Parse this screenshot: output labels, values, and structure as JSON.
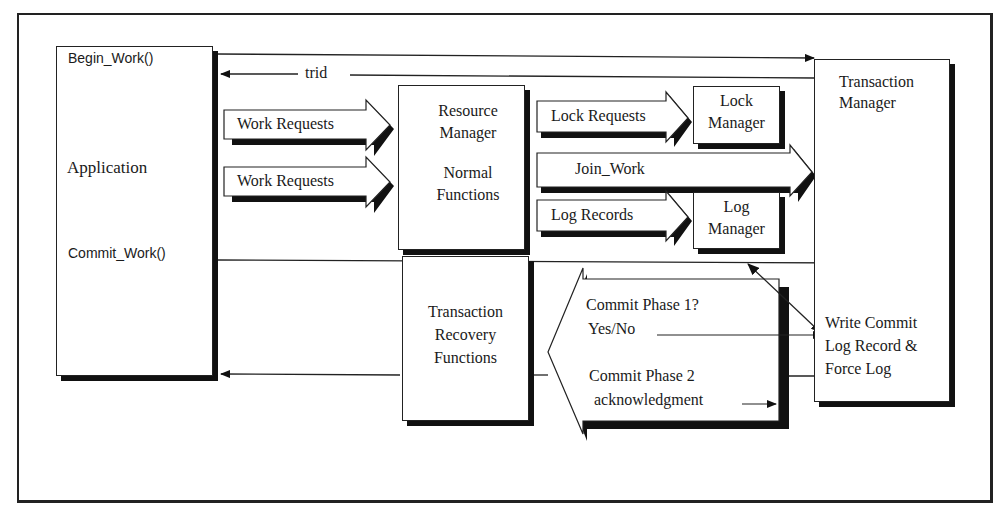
{
  "diagram": {
    "application": {
      "label": "Application",
      "begin_work": "Begin_Work()",
      "commit_work": "Commit_Work()"
    },
    "trid_label": "trid",
    "work_requests": [
      "Work Requests",
      "Work Requests"
    ],
    "resource_manager": {
      "line1": "Resource",
      "line2": "Manager",
      "line3": "Normal",
      "line4": "Functions"
    },
    "recovery": {
      "line1": "Transaction",
      "line2": "Recovery",
      "line3": "Functions"
    },
    "lock_requests": "Lock Requests",
    "join_work": "Join_Work",
    "log_records": "Log Records",
    "lock_manager": {
      "line1": "Lock",
      "line2": "Manager"
    },
    "log_manager": {
      "line1": "Log",
      "line2": "Manager"
    },
    "transaction_manager": {
      "line1": "Transaction",
      "line2": "Manager",
      "write1": "Write Commit",
      "write2": "Log Record &",
      "write3": "Force Log"
    },
    "commit": {
      "phase1": "Commit Phase 1?",
      "yesno": "Yes/No",
      "phase2": "Commit Phase 2",
      "ack": "acknowledgment"
    }
  }
}
